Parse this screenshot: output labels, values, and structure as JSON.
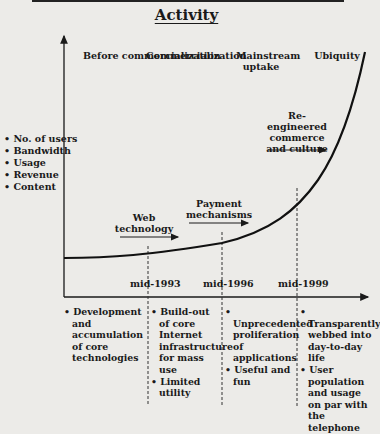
{
  "title": "Activity",
  "eras": [
    {
      "label": "Before commercialization"
    },
    {
      "label": "Commercialization"
    },
    {
      "label": "Mainstream uptake"
    },
    {
      "label": "Ubiquity"
    }
  ],
  "y_axis_metrics": [
    "No. of users",
    "Bandwidth",
    "Usage",
    "Revenue",
    "Content"
  ],
  "drivers": [
    {
      "label": "Web technology"
    },
    {
      "label": "Payment mechanisms"
    },
    {
      "label": "Re-engineered commerce and culture"
    }
  ],
  "milestones": [
    "mid-1993",
    "mid-1996",
    "mid-1999"
  ],
  "phases": [
    {
      "items": [
        "Development and accumulation of core technologies"
      ]
    },
    {
      "items": [
        "Build-out of core Internet infrastructure for mass use",
        "Limited utility"
      ]
    },
    {
      "items": [
        "Unprecedented proliferation of applications",
        "Useful and fun"
      ]
    },
    {
      "items": [
        "Transparently webbed into day-to-day life",
        "User population and usage on par with the telephone"
      ]
    }
  ],
  "colors": {
    "ink": "#1a1a1a",
    "paper": "#ecebe8"
  }
}
